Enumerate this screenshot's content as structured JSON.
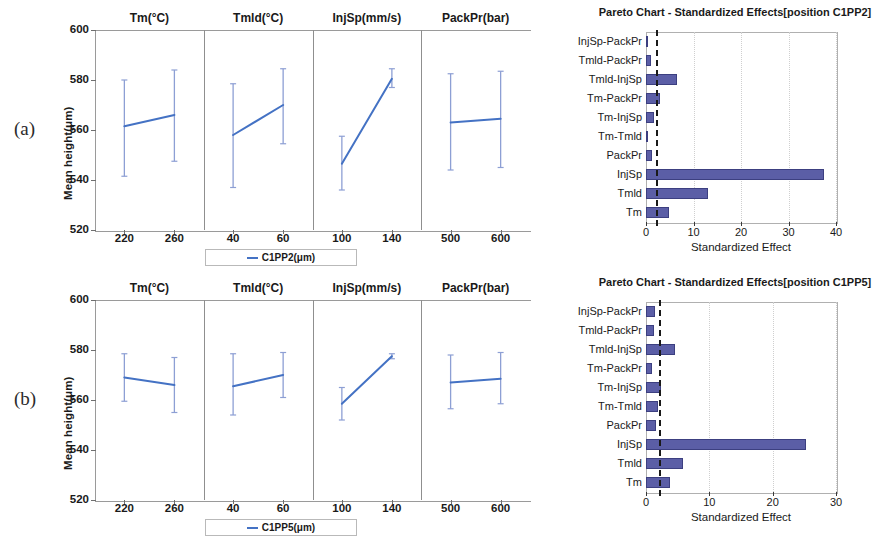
{
  "figure": {
    "panels": [
      {
        "letter": "(a)",
        "main_effects": {
          "ylabel": "Mean height(μm)",
          "yticks": [
            "600",
            "580",
            "560",
            "540",
            "520"
          ],
          "legend_label": "C1PP2(μm)",
          "subplots": [
            {
              "title": "Tm(°C)",
              "xticks": [
                "220",
                "260"
              ]
            },
            {
              "title": "Tmld(°C)",
              "xticks": [
                "40",
                "60"
              ]
            },
            {
              "title": "InjSp(mm/s)",
              "xticks": [
                "100",
                "140"
              ]
            },
            {
              "title": "PackPr(bar)",
              "xticks": [
                "500",
                "600"
              ]
            }
          ]
        },
        "pareto": {
          "title": "Pareto Chart - Standardized Effects[position C1PP2]",
          "xlabel": "Standardized Effect",
          "xticks": [
            "0",
            "10",
            "20",
            "30",
            "40"
          ]
        }
      },
      {
        "letter": "(b)",
        "main_effects": {
          "ylabel": "Mean height(μm)",
          "yticks": [
            "600",
            "580",
            "560",
            "540",
            "520"
          ],
          "legend_label": "C1PP5(μm)",
          "subplots": [
            {
              "title": "Tm(°C)",
              "xticks": [
                "220",
                "260"
              ]
            },
            {
              "title": "Tmld(°C)",
              "xticks": [
                "40",
                "60"
              ]
            },
            {
              "title": "InjSp(mm/s)",
              "xticks": [
                "100",
                "140"
              ]
            },
            {
              "title": "PackPr(bar)",
              "xticks": [
                "500",
                "600"
              ]
            }
          ]
        },
        "pareto": {
          "title": "Pareto Chart - Standardized Effects[position C1PP5]",
          "xlabel": "Standardized Effect",
          "xticks": [
            "0",
            "10",
            "20",
            "30"
          ]
        }
      }
    ]
  },
  "colors": {
    "line": "#4472c4",
    "errorbar": "#8d9fd4",
    "bar_fill": "#5b5ea6",
    "bar_edge": "#3c3f80",
    "axis": "#9a9a9a",
    "reference_line": "#1a1a1a"
  },
  "chart_data": [
    {
      "type": "line",
      "name": "main-effects-C1PP2",
      "panel": "(a)",
      "title": "",
      "xlabel": "",
      "ylabel": "Mean height(μm)",
      "ylim": [
        520,
        600
      ],
      "yticks": [
        600,
        580,
        560,
        540,
        520
      ],
      "grid": false,
      "legend": [
        "C1PP2(μm)"
      ],
      "legend_position": "bottom-center",
      "facets": [
        {
          "factor": "Tm(°C)",
          "unit": "°C",
          "x": [
            220,
            260
          ],
          "values": [
            561.5,
            566.0
          ],
          "err_low": [
            541.5,
            547.5
          ],
          "err_high": [
            580.0,
            584.0
          ]
        },
        {
          "factor": "Tmld(°C)",
          "unit": "°C",
          "x": [
            40,
            60
          ],
          "values": [
            558.0,
            570.0
          ],
          "err_low": [
            537.0,
            554.5
          ],
          "err_high": [
            578.5,
            584.5
          ]
        },
        {
          "factor": "InjSp(mm/s)",
          "unit": "mm/s",
          "x": [
            100,
            140
          ],
          "values": [
            546.5,
            580.5
          ],
          "err_low": [
            536.0,
            577.0
          ],
          "err_high": [
            557.5,
            584.5
          ]
        },
        {
          "factor": "PackPr(bar)",
          "unit": "bar",
          "x": [
            500,
            600
          ],
          "values": [
            563.0,
            564.5
          ],
          "err_low": [
            544.0,
            545.0
          ],
          "err_high": [
            582.5,
            583.5
          ]
        }
      ]
    },
    {
      "type": "bar",
      "orientation": "horizontal",
      "name": "pareto-C1PP2",
      "panel": "(a)",
      "title": "Pareto Chart - Standardized Effects[position C1PP2]",
      "xlabel": "Standardized Effect",
      "ylabel": "",
      "xlim": [
        0,
        40
      ],
      "xticks": [
        0,
        10,
        20,
        30,
        40
      ],
      "grid": false,
      "reference_line": 2.0,
      "categories": [
        "InjSp-PackPr",
        "Tmld-PackPr",
        "Tmld-InjSp",
        "Tm-PackPr",
        "Tm-InjSp",
        "Tm-Tmld",
        "PackPr",
        "InjSp",
        "Tmld",
        "Tm"
      ],
      "values": [
        0.15,
        0.95,
        6.5,
        3.0,
        1.7,
        0.15,
        1.2,
        37.5,
        13.0,
        4.9
      ]
    },
    {
      "type": "line",
      "name": "main-effects-C1PP5",
      "panel": "(b)",
      "title": "",
      "xlabel": "",
      "ylabel": "Mean height(μm)",
      "ylim": [
        520,
        600
      ],
      "yticks": [
        600,
        580,
        560,
        540,
        520
      ],
      "grid": false,
      "legend": [
        "C1PP5(μm)"
      ],
      "legend_position": "bottom-center",
      "facets": [
        {
          "factor": "Tm(°C)",
          "unit": "°C",
          "x": [
            220,
            260
          ],
          "values": [
            569.0,
            566.0
          ],
          "err_low": [
            559.5,
            555.0
          ],
          "err_high": [
            578.5,
            577.0
          ]
        },
        {
          "factor": "Tmld(°C)",
          "unit": "°C",
          "x": [
            40,
            60
          ],
          "values": [
            565.5,
            570.0
          ],
          "err_low": [
            554.0,
            561.0
          ],
          "err_high": [
            578.5,
            579.0
          ]
        },
        {
          "factor": "InjSp(mm/s)",
          "unit": "mm/s",
          "x": [
            100,
            140
          ],
          "values": [
            558.5,
            577.5
          ],
          "err_low": [
            552.0,
            576.5
          ],
          "err_high": [
            565.0,
            578.5
          ]
        },
        {
          "factor": "PackPr(bar)",
          "unit": "bar",
          "x": [
            500,
            600
          ],
          "values": [
            567.0,
            568.5
          ],
          "err_low": [
            556.5,
            558.5
          ],
          "err_high": [
            578.0,
            579.0
          ]
        }
      ]
    },
    {
      "type": "bar",
      "orientation": "horizontal",
      "name": "pareto-C1PP5",
      "panel": "(b)",
      "title": "Pareto Chart - Standardized Effects[position C1PP5]",
      "xlabel": "Standardized Effect",
      "ylabel": "",
      "xlim": [
        0,
        30
      ],
      "xticks": [
        0,
        10,
        20,
        30
      ],
      "grid": false,
      "reference_line": 2.0,
      "categories": [
        "InjSp-PackPr",
        "Tmld-PackPr",
        "Tmld-InjSp",
        "Tm-PackPr",
        "Tm-InjSp",
        "Tm-Tmld",
        "PackPr",
        "InjSp",
        "Tmld",
        "Tm"
      ],
      "values": [
        1.4,
        1.3,
        4.5,
        0.9,
        2.3,
        1.9,
        1.6,
        25.2,
        5.9,
        3.8
      ]
    }
  ]
}
